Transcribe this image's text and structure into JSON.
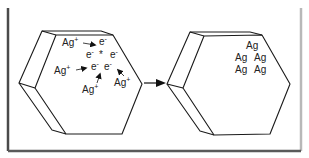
{
  "diagram": {
    "colors": {
      "stroke": "#1a1a1a",
      "frame_dark": "#4a4a4a",
      "frame_light": "#b0b0b0",
      "text": "#222222"
    },
    "left_crystal": {
      "ions": [
        {
          "base": "Ag",
          "charge": "+"
        },
        {
          "base": "Ag",
          "charge": "+"
        },
        {
          "base": "Ag",
          "charge": "+"
        },
        {
          "base": "Ag",
          "charge": "+"
        }
      ],
      "electrons": [
        {
          "base": "e",
          "charge": "-"
        },
        {
          "base": "e",
          "charge": "-"
        },
        {
          "base": "e",
          "charge": "-"
        },
        {
          "base": "e",
          "charge": "-"
        },
        {
          "base": "e",
          "charge": "-"
        }
      ],
      "center_symbol": "*"
    },
    "arrow": "reaction-arrow",
    "right_crystal": {
      "atoms": [
        "Ag",
        "Ag",
        "Ag",
        "Ag",
        "Ag"
      ]
    }
  }
}
